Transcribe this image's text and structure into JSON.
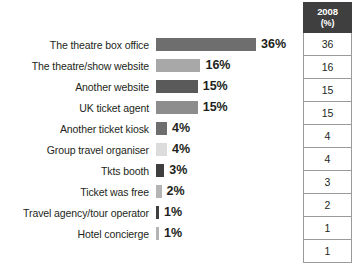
{
  "chart_data": {
    "type": "bar",
    "title": "",
    "subtitle": "",
    "xlabel": "",
    "ylabel": "",
    "orientation": "horizontal",
    "grid": false,
    "legend": "none",
    "xlim": [
      0,
      40
    ],
    "value_suffix": "%",
    "categories": [
      "The theatre box office",
      "The theatre/show website",
      "Another website",
      "UK ticket agent",
      "Another ticket kiosk",
      "Group travel organiser",
      "Tkts booth",
      "Ticket was free",
      "Travel agency/tour operator",
      "Hotel concierge"
    ],
    "values": [
      36,
      16,
      15,
      15,
      4,
      4,
      3,
      2,
      1,
      1
    ],
    "value_labels": [
      "36%",
      "16%",
      "15%",
      "15%",
      "4%",
      "4%",
      "3%",
      "2%",
      "1%",
      "1%"
    ],
    "bar_colors": [
      "#6e6e6e",
      "#a8a8a8",
      "#5a5a5a",
      "#8d8d8d",
      "#6e6e6e",
      "#dcdcdc",
      "#3f3f3f",
      "#b4b4b4",
      "#3f3f3f",
      "#b4b4b4"
    ]
  },
  "bar_rows": [
    {
      "label": "The theatre box office",
      "value_label": "36%",
      "value": 36,
      "color": "#6e6e6e"
    },
    {
      "label": "The theatre/show website",
      "value_label": "16%",
      "value": 16,
      "color": "#a8a8a8"
    },
    {
      "label": "Another website",
      "value_label": "15%",
      "value": 15,
      "color": "#5a5a5a"
    },
    {
      "label": "UK ticket agent",
      "value_label": "15%",
      "value": 15,
      "color": "#8d8d8d"
    },
    {
      "label": "Another ticket kiosk",
      "value_label": "4%",
      "value": 4,
      "color": "#6e6e6e"
    },
    {
      "label": "Group travel organiser",
      "value_label": "4%",
      "value": 4,
      "color": "#dcdcdc"
    },
    {
      "label": "Tkts booth",
      "value_label": "3%",
      "value": 3,
      "color": "#3f3f3f"
    },
    {
      "label": "Ticket was free",
      "value_label": "2%",
      "value": 2,
      "color": "#b4b4b4"
    },
    {
      "label": "Travel agency/tour operator",
      "value_label": "1%",
      "value": 1,
      "color": "#3f3f3f"
    },
    {
      "label": "Hotel concierge",
      "value_label": "1%",
      "value": 1,
      "color": "#b4b4b4"
    }
  ],
  "table": {
    "header": {
      "year": "2008",
      "unit": "(%)"
    },
    "rows": [
      "36",
      "16",
      "15",
      "15",
      "4",
      "4",
      "3",
      "2",
      "1",
      "1"
    ]
  },
  "scale": {
    "px_per_unit": 2.78,
    "min_bar_px": 3
  }
}
